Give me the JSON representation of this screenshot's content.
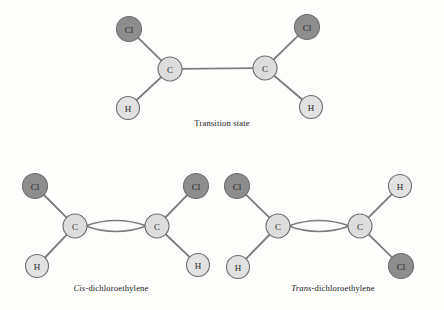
{
  "figure": {
    "background_color": "#fdfdfc",
    "bond_color": "#7d7d7d",
    "atom_colors": {
      "Cl": "#8d8d8d",
      "C": "#dddddd",
      "H": "#e2e2e2",
      "outline": "#6e6e6e"
    }
  },
  "chart_data": {
    "type": "diagram",
    "structures": [
      {
        "id": "transition-state",
        "caption_prefix": "",
        "caption_rest": "Transition state",
        "bond_type": "single",
        "atoms": [
          {
            "element": "Cl",
            "label": "Cl",
            "x": 129,
            "y": 29,
            "r": 12.5,
            "role": "substituent-upper-left"
          },
          {
            "element": "C",
            "label": "C",
            "x": 170,
            "y": 69,
            "r": 12.0,
            "role": "carbon-left"
          },
          {
            "element": "H",
            "label": "H",
            "x": 128,
            "y": 108,
            "r": 11.5,
            "role": "substituent-lower-left"
          },
          {
            "element": "C",
            "label": "C",
            "x": 265,
            "y": 68,
            "r": 12.0,
            "role": "carbon-right"
          },
          {
            "element": "Cl",
            "label": "Cl",
            "x": 307,
            "y": 27,
            "r": 12.5,
            "role": "substituent-upper-right"
          },
          {
            "element": "H",
            "label": "H",
            "x": 311,
            "y": 107,
            "r": 11.5,
            "role": "substituent-lower-right"
          }
        ],
        "bonds": [
          {
            "from": 0,
            "to": 1,
            "order": 1
          },
          {
            "from": 2,
            "to": 1,
            "order": 1
          },
          {
            "from": 1,
            "to": 3,
            "order": 1
          },
          {
            "from": 3,
            "to": 4,
            "order": 1
          },
          {
            "from": 3,
            "to": 5,
            "order": 1
          }
        ]
      },
      {
        "id": "cis-dichloroethylene",
        "caption_prefix": "Cis",
        "caption_rest": "-dichloroethylene",
        "bond_type": "double",
        "atoms": [
          {
            "element": "Cl",
            "label": "Cl",
            "x": 35,
            "y": 186,
            "r": 12.5,
            "role": "substituent-upper-left"
          },
          {
            "element": "C",
            "label": "C",
            "x": 75,
            "y": 226,
            "r": 12.0,
            "role": "carbon-left"
          },
          {
            "element": "H",
            "label": "H",
            "x": 37,
            "y": 266,
            "r": 11.5,
            "role": "substituent-lower-left"
          },
          {
            "element": "C",
            "label": "C",
            "x": 157,
            "y": 226,
            "r": 12.0,
            "role": "carbon-right"
          },
          {
            "element": "Cl",
            "label": "Cl",
            "x": 196,
            "y": 186,
            "r": 12.5,
            "role": "substituent-upper-right"
          },
          {
            "element": "H",
            "label": "H",
            "x": 198,
            "y": 265,
            "r": 11.5,
            "role": "substituent-lower-right"
          }
        ],
        "bonds": [
          {
            "from": 0,
            "to": 1,
            "order": 1
          },
          {
            "from": 2,
            "to": 1,
            "order": 1
          },
          {
            "from": 1,
            "to": 3,
            "order": 2
          },
          {
            "from": 3,
            "to": 4,
            "order": 1
          },
          {
            "from": 3,
            "to": 5,
            "order": 1
          }
        ]
      },
      {
        "id": "trans-dichloroethylene",
        "caption_prefix": "Trans",
        "caption_rest": "-dichloroethylene",
        "bond_type": "double",
        "atoms": [
          {
            "element": "Cl",
            "label": "Cl",
            "x": 237,
            "y": 186,
            "r": 12.5,
            "role": "substituent-upper-left"
          },
          {
            "element": "C",
            "label": "C",
            "x": 278,
            "y": 226,
            "r": 12.0,
            "role": "carbon-left"
          },
          {
            "element": "H",
            "label": "H",
            "x": 238,
            "y": 267,
            "r": 11.5,
            "role": "substituent-lower-left"
          },
          {
            "element": "C",
            "label": "C",
            "x": 360,
            "y": 226,
            "r": 12.0,
            "role": "carbon-right"
          },
          {
            "element": "H",
            "label": "H",
            "x": 400,
            "y": 186,
            "r": 11.5,
            "role": "substituent-upper-right"
          },
          {
            "element": "Cl",
            "label": "Cl",
            "x": 401,
            "y": 266,
            "r": 12.5,
            "role": "substituent-lower-right"
          }
        ],
        "bonds": [
          {
            "from": 0,
            "to": 1,
            "order": 1
          },
          {
            "from": 2,
            "to": 1,
            "order": 1
          },
          {
            "from": 1,
            "to": 3,
            "order": 2
          },
          {
            "from": 3,
            "to": 4,
            "order": 1
          },
          {
            "from": 3,
            "to": 5,
            "order": 1
          }
        ]
      }
    ]
  },
  "captions": {
    "transition": {
      "prefix": "",
      "rest": "Transition state"
    },
    "cis": {
      "prefix": "Cis",
      "rest": "-dichloroethylene"
    },
    "trans": {
      "prefix": "Trans",
      "rest": "-dichloroethylene"
    }
  }
}
